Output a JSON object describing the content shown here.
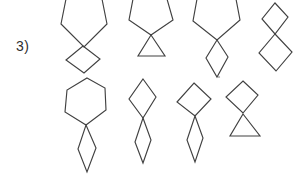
{
  "page": {
    "background": "#ffffff",
    "stroke_color": "#414141"
  },
  "label": {
    "text": "3)"
  },
  "figures": [
    {
      "id": "top-1",
      "description": "hexagon with square diamond attached at bottom vertex",
      "parts": [
        {
          "name": "hexagon",
          "points": "66,-1 102,-1 107,24 84,47 61,24"
        },
        {
          "name": "diamond",
          "points": "83,46 100,59 84,73 66,60"
        }
      ]
    },
    {
      "id": "top-2",
      "description": "hexagon with triangle attached at bottom vertex",
      "parts": [
        {
          "name": "hexagon",
          "points": "133,-1 167,-1 173,20 151,35 129,20"
        },
        {
          "name": "triangle",
          "points": "151,35 165,56 138,56"
        }
      ]
    },
    {
      "id": "top-3",
      "description": "hexagon with rhombus attached at bottom vertex",
      "parts": [
        {
          "name": "hexagon",
          "points": "197,-1 236,-1 240,20 217,40 193,21"
        },
        {
          "name": "rhombus",
          "points": "217,40 228,57 217,77 206,58"
        }
      ]
    },
    {
      "id": "top-4",
      "description": "small diamond with larger diamond attached at bottom vertex",
      "parts": [
        {
          "name": "diamond-small",
          "points": "275,3 288,17 275,34 262,19"
        },
        {
          "name": "diamond-large",
          "points": "275,34 292,52 276,71 259,53"
        }
      ]
    },
    {
      "id": "bottom-1",
      "description": "hexagon with narrow rhombus attached at bottom vertex",
      "parts": [
        {
          "name": "hexagon",
          "points": "87,78 105,88 106,110 86,125 65,112 67,90"
        },
        {
          "name": "rhombus-narrow",
          "points": "86,125 96,148 87,172 78,149"
        }
      ]
    },
    {
      "id": "bottom-2",
      "description": "tall diamond with narrow rhombus attached at bottom vertex",
      "parts": [
        {
          "name": "diamond",
          "points": "143,79 156,97 143,118 129,99"
        },
        {
          "name": "rhombus-narrow",
          "points": "143,118 151,140 143,163 135,142"
        }
      ]
    },
    {
      "id": "bottom-3",
      "description": "square diamond with narrow rhombus attached at bottom vertex",
      "parts": [
        {
          "name": "diamond",
          "points": "194,83 211,99 195,116 177,102"
        },
        {
          "name": "rhombus-narrow",
          "points": "195,116 203,138 195,162 187,140"
        }
      ]
    },
    {
      "id": "bottom-4",
      "description": "diamond with triangle attached at bottom vertex",
      "parts": [
        {
          "name": "diamond",
          "points": "243,81 258,95 243,113 226,97"
        },
        {
          "name": "triangle",
          "points": "243,114 260,136 230,136"
        }
      ]
    }
  ],
  "artifacts": [
    {
      "name": "stray-dot",
      "cx": 219,
      "cy": 77,
      "r": 1.1
    }
  ]
}
